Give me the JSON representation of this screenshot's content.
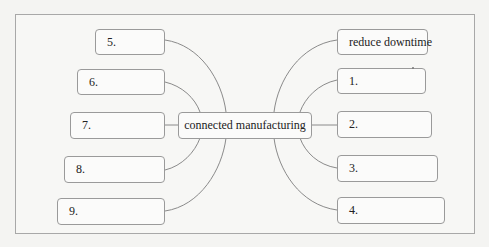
{
  "diagram": {
    "center": {
      "label": "connected manufacturing"
    },
    "left_nodes": [
      {
        "id": "5",
        "label": "5."
      },
      {
        "id": "6",
        "label": "6."
      },
      {
        "id": "7",
        "label": "7."
      },
      {
        "id": "8",
        "label": "8."
      },
      {
        "id": "9",
        "label": "9."
      }
    ],
    "right_nodes": [
      {
        "id": "reduce",
        "label": "reduce downtime"
      },
      {
        "id": "1",
        "label": "1."
      },
      {
        "id": "2",
        "label": "2."
      },
      {
        "id": "3",
        "label": "3."
      },
      {
        "id": "4",
        "label": "4."
      }
    ],
    "colors": {
      "border": "#9a9a9a",
      "link": "#8a8a8a",
      "background": "#f7f7f5"
    }
  }
}
